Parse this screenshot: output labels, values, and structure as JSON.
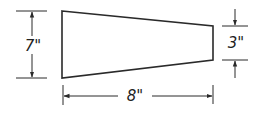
{
  "diagram": {
    "type": "trapezoid-dimension-drawing",
    "stroke_color": "#2a2a2a",
    "shape": {
      "name": "trapezoid",
      "left_height": "7\"",
      "right_height": "3\"",
      "width": "8\""
    },
    "labels": {
      "left_dimension": "7\"",
      "right_dimension": "3\"",
      "bottom_dimension": "8\""
    }
  }
}
